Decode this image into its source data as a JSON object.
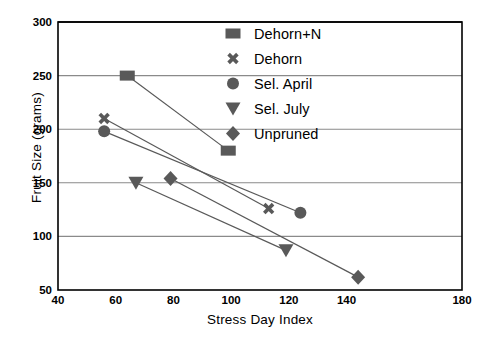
{
  "chart_data": {
    "type": "scatter",
    "title": "",
    "xlabel": "Stress Day Index",
    "ylabel": "Fruit Size (grams)",
    "xlim": [
      40,
      180
    ],
    "ylim": [
      50,
      300
    ],
    "xticks": [
      40,
      60,
      80,
      100,
      120,
      140,
      180
    ],
    "yticks": [
      50,
      100,
      150,
      200,
      250,
      300
    ],
    "grid": "horizontal",
    "legend_position": "top-right",
    "marker_color": "#595959",
    "line_color": "#595959",
    "series": [
      {
        "name": "Dehorn+N",
        "marker": "square",
        "points": [
          {
            "x": 64,
            "y": 250
          },
          {
            "x": 99,
            "y": 180
          }
        ]
      },
      {
        "name": "Dehorn",
        "marker": "cross-x",
        "points": [
          {
            "x": 56,
            "y": 210
          },
          {
            "x": 113,
            "y": 126
          }
        ]
      },
      {
        "name": "Sel. April",
        "marker": "circle",
        "points": [
          {
            "x": 56,
            "y": 198
          },
          {
            "x": 124,
            "y": 122
          }
        ]
      },
      {
        "name": "Sel. July",
        "marker": "triangle-down",
        "points": [
          {
            "x": 67,
            "y": 150
          },
          {
            "x": 119,
            "y": 87
          }
        ]
      },
      {
        "name": "Unpruned",
        "marker": "diamond",
        "points": [
          {
            "x": 79,
            "y": 154
          },
          {
            "x": 144,
            "y": 62
          }
        ]
      }
    ]
  },
  "axis": {
    "ylabel_text": "Fruit Size (grams)",
    "xlabel_text": "Stress Day Index",
    "ytick_labels": [
      "300",
      "250",
      "200",
      "150",
      "100",
      "50"
    ],
    "xtick_labels": [
      "40",
      "60",
      "80",
      "100",
      "120",
      "140",
      "180"
    ]
  },
  "legend": {
    "items": [
      {
        "label": "Dehorn+N",
        "marker": "square"
      },
      {
        "label": "Dehorn",
        "marker": "cross-x"
      },
      {
        "label": "Sel. April",
        "marker": "circle"
      },
      {
        "label": "Sel. July",
        "marker": "triangle-down"
      },
      {
        "label": "Unpruned",
        "marker": "diamond"
      }
    ]
  }
}
